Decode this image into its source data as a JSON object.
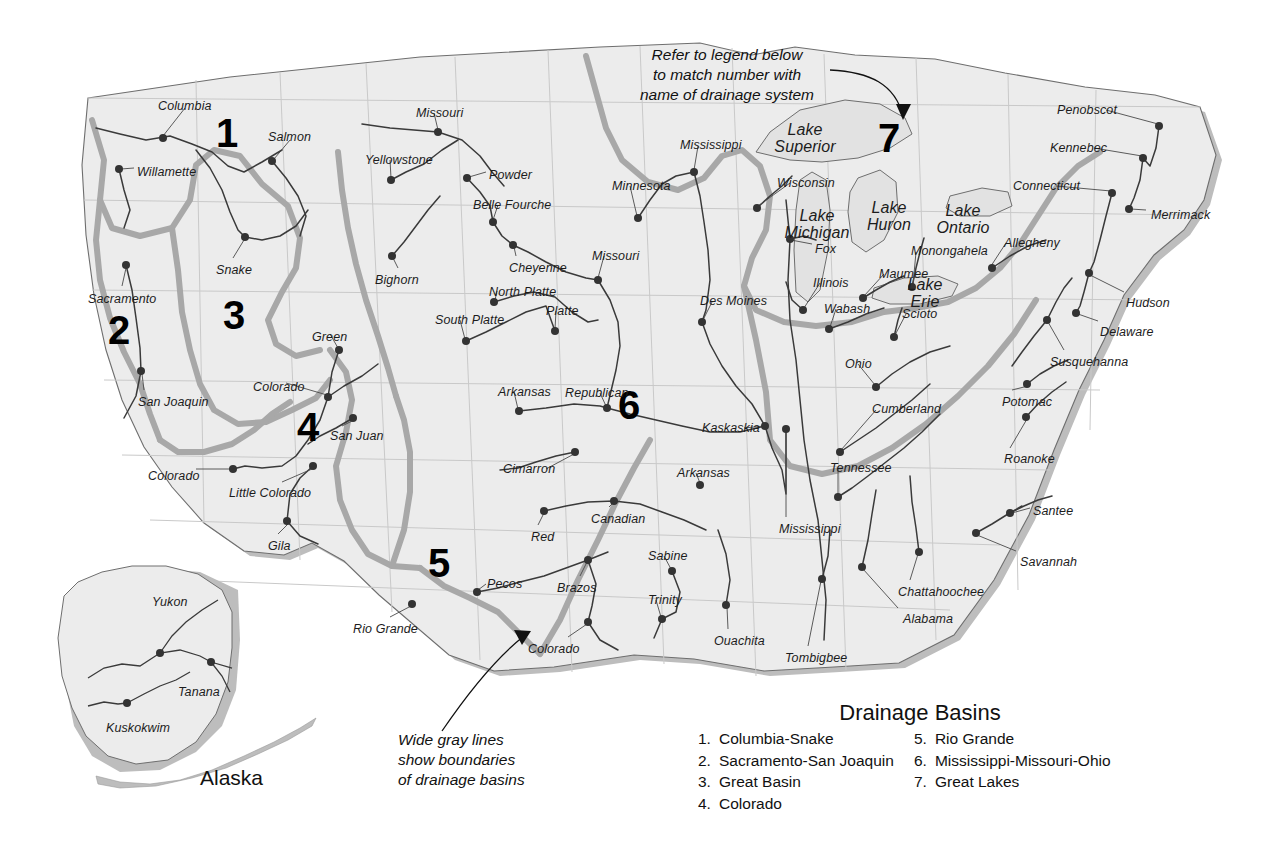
{
  "map": {
    "title_region": "United States Drainage Basins",
    "alaska_caption": "Alaska"
  },
  "annotations": [
    {
      "name": "legend-reference-note",
      "lines": [
        "Refer to legend below",
        "to match number with",
        "name of drainage system"
      ]
    },
    {
      "name": "gray-lines-note",
      "lines": [
        "Wide gray lines",
        "show boundaries",
        "of drainage basins"
      ]
    }
  ],
  "basin_numbers": [
    {
      "num": "1",
      "x": 216,
      "y": 113
    },
    {
      "num": "2",
      "x": 108,
      "y": 310
    },
    {
      "num": "3",
      "x": 223,
      "y": 295
    },
    {
      "num": "4",
      "x": 297,
      "y": 407
    },
    {
      "num": "5",
      "x": 428,
      "y": 543
    },
    {
      "num": "6",
      "x": 618,
      "y": 385
    },
    {
      "num": "7",
      "x": 878,
      "y": 118
    }
  ],
  "legend": {
    "title": "Drainage Basins",
    "column_left": [
      {
        "num": "1.",
        "label": "Columbia-Snake"
      },
      {
        "num": "2.",
        "label": "Sacramento-San Joaquin"
      },
      {
        "num": "3.",
        "label": "Great Basin"
      },
      {
        "num": "4.",
        "label": "Colorado"
      }
    ],
    "column_right": [
      {
        "num": "5.",
        "label": "Rio Grande"
      },
      {
        "num": "6.",
        "label": "Mississippi-Missouri-Ohio"
      },
      {
        "num": "7.",
        "label": "Great Lakes"
      }
    ]
  },
  "lake_labels": [
    {
      "label": "Lake\nSuperior",
      "x": 800,
      "y": 122
    },
    {
      "label": "Lake\nMichigan",
      "x": 812,
      "y": 208
    },
    {
      "label": "Lake\nHuron",
      "x": 884,
      "y": 200
    },
    {
      "label": "Lake\nOntario",
      "x": 958,
      "y": 203
    },
    {
      "label": "Lake\nErie",
      "x": 920,
      "y": 277
    }
  ],
  "river_labels": [
    {
      "label": "Columbia",
      "x": 158,
      "y": 100,
      "dot_x": 163,
      "dot_y": 138
    },
    {
      "label": "Willamette",
      "x": 137,
      "y": 166,
      "dot_x": 119,
      "dot_y": 169
    },
    {
      "label": "Salmon",
      "x": 268,
      "y": 131,
      "dot_x": 272,
      "dot_y": 161
    },
    {
      "label": "Snake",
      "x": 216,
      "y": 264,
      "dot_x": 245,
      "dot_y": 237
    },
    {
      "label": "Sacramento",
      "x": 88,
      "y": 293,
      "dot_x": 126,
      "dot_y": 265
    },
    {
      "label": "San Joaquin",
      "x": 138,
      "y": 396,
      "dot_x": 141,
      "dot_y": 371
    },
    {
      "label": "Colorado",
      "x": 253,
      "y": 381,
      "dot_x": 328,
      "dot_y": 397
    },
    {
      "label": "San Juan",
      "x": 330,
      "y": 430,
      "dot_x": 353,
      "dot_y": 418
    },
    {
      "label": "Colorado",
      "x": 148,
      "y": 470,
      "dot_x": 233,
      "dot_y": 469
    },
    {
      "label": "Little Colorado",
      "x": 229,
      "y": 487,
      "dot_x": 313,
      "dot_y": 466
    },
    {
      "label": "Gila",
      "x": 268,
      "y": 540,
      "dot_x": 287,
      "dot_y": 521
    },
    {
      "label": "Green",
      "x": 312,
      "y": 331,
      "dot_x": 339,
      "dot_y": 350
    },
    {
      "label": "Yellowstone",
      "x": 365,
      "y": 154,
      "dot_x": 391,
      "dot_y": 180
    },
    {
      "label": "Missouri",
      "x": 416,
      "y": 107,
      "dot_x": 438,
      "dot_y": 132
    },
    {
      "label": "Powder",
      "x": 489,
      "y": 169,
      "dot_x": 467,
      "dot_y": 178
    },
    {
      "label": "Belle Fourche",
      "x": 473,
      "y": 199,
      "dot_x": 493,
      "dot_y": 222
    },
    {
      "label": "Bighorn",
      "x": 375,
      "y": 274,
      "dot_x": 392,
      "dot_y": 256
    },
    {
      "label": "Cheyenne",
      "x": 509,
      "y": 262,
      "dot_x": 513,
      "dot_y": 245
    },
    {
      "label": "North Platte",
      "x": 489,
      "y": 286,
      "dot_x": 494,
      "dot_y": 302
    },
    {
      "label": "South Platte",
      "x": 435,
      "y": 314,
      "dot_x": 466,
      "dot_y": 341
    },
    {
      "label": "Platte",
      "x": 546,
      "y": 305,
      "dot_x": 555,
      "dot_y": 331
    },
    {
      "label": "Missouri",
      "x": 592,
      "y": 250,
      "dot_x": 598,
      "dot_y": 280
    },
    {
      "label": "Minnesota",
      "x": 612,
      "y": 180,
      "dot_x": 638,
      "dot_y": 218
    },
    {
      "label": "Mississippi",
      "x": 680,
      "y": 139,
      "dot_x": 694,
      "dot_y": 172
    },
    {
      "label": "Des Moines",
      "x": 700,
      "y": 295,
      "dot_x": 702,
      "dot_y": 322
    },
    {
      "label": "Republican",
      "x": 565,
      "y": 387,
      "dot_x": 607,
      "dot_y": 408
    },
    {
      "label": "Arkansas",
      "x": 498,
      "y": 386,
      "dot_x": 519,
      "dot_y": 411
    },
    {
      "label": "Cimarron",
      "x": 503,
      "y": 463,
      "dot_x": 575,
      "dot_y": 452
    },
    {
      "label": "Red",
      "x": 531,
      "y": 531,
      "dot_x": 544,
      "dot_y": 511
    },
    {
      "label": "Canadian",
      "x": 591,
      "y": 513,
      "dot_x": 614,
      "dot_y": 501
    },
    {
      "label": "Arkansas",
      "x": 677,
      "y": 467,
      "dot_x": 700,
      "dot_y": 485
    },
    {
      "label": "Pecos",
      "x": 487,
      "y": 578,
      "dot_x": 477,
      "dot_y": 592
    },
    {
      "label": "Brazos",
      "x": 557,
      "y": 582,
      "dot_x": 588,
      "dot_y": 560
    },
    {
      "label": "Colorado",
      "x": 528,
      "y": 643,
      "dot_x": 588,
      "dot_y": 622
    },
    {
      "label": "Rio Grande",
      "x": 353,
      "y": 623,
      "dot_x": 412,
      "dot_y": 604
    },
    {
      "label": "Trinity",
      "x": 648,
      "y": 594,
      "dot_x": 662,
      "dot_y": 619
    },
    {
      "label": "Sabine",
      "x": 648,
      "y": 550,
      "dot_x": 672,
      "dot_y": 571
    },
    {
      "label": "Ouachita",
      "x": 714,
      "y": 635,
      "dot_x": 726,
      "dot_y": 605
    },
    {
      "label": "Kaskaskia",
      "x": 702,
      "y": 422,
      "dot_x": 765,
      "dot_y": 426
    },
    {
      "label": "Mississippi",
      "x": 779,
      "y": 523,
      "dot_x": 786,
      "dot_y": 429
    },
    {
      "label": "Tombigbee",
      "x": 785,
      "y": 652,
      "dot_x": 822,
      "dot_y": 579
    },
    {
      "label": "Tennessee",
      "x": 830,
      "y": 462,
      "dot_x": 838,
      "dot_y": 497
    },
    {
      "label": "Cumberland",
      "x": 872,
      "y": 403,
      "dot_x": 840,
      "dot_y": 452
    },
    {
      "label": "Ohio",
      "x": 845,
      "y": 358,
      "dot_x": 876,
      "dot_y": 387
    },
    {
      "label": "Wabash",
      "x": 824,
      "y": 303,
      "dot_x": 829,
      "dot_y": 329
    },
    {
      "label": "Illinois",
      "x": 813,
      "y": 277,
      "dot_x": 803,
      "dot_y": 310
    },
    {
      "label": "Maumee",
      "x": 879,
      "y": 268,
      "dot_x": 863,
      "dot_y": 298
    },
    {
      "label": "Scioto",
      "x": 902,
      "y": 308,
      "dot_x": 894,
      "dot_y": 337
    },
    {
      "label": "Monongahela",
      "x": 911,
      "y": 245,
      "dot_x": 912,
      "dot_y": 287
    },
    {
      "label": "Wisconsin",
      "x": 777,
      "y": 177,
      "dot_x": 757,
      "dot_y": 208
    },
    {
      "label": "Fox",
      "x": 815,
      "y": 243,
      "dot_x": 790,
      "dot_y": 239
    },
    {
      "label": "Allegheny",
      "x": 1004,
      "y": 237,
      "dot_x": 992,
      "dot_y": 268
    },
    {
      "label": "Connecticut",
      "x": 1013,
      "y": 180,
      "dot_x": 1112,
      "dot_y": 193
    },
    {
      "label": "Penobscot",
      "x": 1057,
      "y": 104,
      "dot_x": 1159,
      "dot_y": 126
    },
    {
      "label": "Kennebec",
      "x": 1050,
      "y": 142,
      "dot_x": 1143,
      "dot_y": 158
    },
    {
      "label": "Merrimack",
      "x": 1151,
      "y": 209,
      "dot_x": 1129,
      "dot_y": 209
    },
    {
      "label": "Hudson",
      "x": 1126,
      "y": 297,
      "dot_x": 1089,
      "dot_y": 273
    },
    {
      "label": "Delaware",
      "x": 1100,
      "y": 326,
      "dot_x": 1076,
      "dot_y": 313
    },
    {
      "label": "Susquehanna",
      "x": 1050,
      "y": 356,
      "dot_x": 1047,
      "dot_y": 320
    },
    {
      "label": "Potomac",
      "x": 1002,
      "y": 396,
      "dot_x": 1027,
      "dot_y": 384
    },
    {
      "label": "Roanoke",
      "x": 1004,
      "y": 453,
      "dot_x": 1026,
      "dot_y": 417
    },
    {
      "label": "Santee",
      "x": 1033,
      "y": 505,
      "dot_x": 1010,
      "dot_y": 513
    },
    {
      "label": "Savannah",
      "x": 1020,
      "y": 556,
      "dot_x": 976,
      "dot_y": 533
    },
    {
      "label": "Chattahoochee",
      "x": 898,
      "y": 586,
      "dot_x": 919,
      "dot_y": 552
    },
    {
      "label": "Alabama",
      "x": 903,
      "y": 613,
      "dot_x": 862,
      "dot_y": 567
    },
    {
      "label": "Yukon",
      "x": 152,
      "y": 596,
      "dot_x": 160,
      "dot_y": 653
    },
    {
      "label": "Tanana",
      "x": 178,
      "y": 686,
      "dot_x": 211,
      "dot_y": 662
    },
    {
      "label": "Kuskokwim",
      "x": 106,
      "y": 722,
      "dot_x": 127,
      "dot_y": 703
    }
  ],
  "colors": {
    "land": "#ececec",
    "land_stroke": "#6e6e6e",
    "state_line": "#c9c9c9",
    "river": "#3a3a3a",
    "basin_boundary": "#a8a8a8",
    "ocean_shadow": "#bdbdbd",
    "lake_fill": "#e2e2e2",
    "text": "#1a1a1a"
  }
}
